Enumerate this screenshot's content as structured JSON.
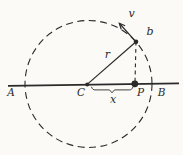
{
  "figure": {
    "description_type": "circular-motion-projection-diagram",
    "labels": {
      "endpoint_left": "A",
      "endpoint_right": "B",
      "center": "C",
      "projection_point": "P",
      "particle": "b",
      "radius": "r",
      "velocity": "v",
      "displacement": "x"
    },
    "colors": {
      "ink": "#2a2a2a",
      "paper": "#fbfaf7"
    }
  }
}
